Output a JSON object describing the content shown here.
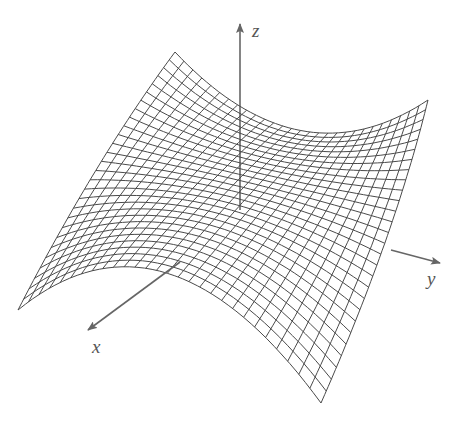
{
  "figure": {
    "surface_equation": "z = y^2 - x^2",
    "grid_divisions": 28,
    "line_color": "#4a4a4a",
    "axis_color": "#666666",
    "background": "#ffffff"
  },
  "axes": {
    "x": {
      "label": "x"
    },
    "y": {
      "label": "y"
    },
    "z": {
      "label": "z"
    }
  },
  "patch": {
    "corners": {
      "A": [
        18,
        310
      ],
      "B": [
        175,
        52
      ],
      "C": [
        428,
        100
      ],
      "D": [
        321,
        403
      ]
    },
    "edge_controls": {
      "AB": [
        95,
        160
      ],
      "BC": [
        300,
        185
      ],
      "AD": [
        165,
        190
      ],
      "DC": [
        395,
        235
      ]
    }
  }
}
